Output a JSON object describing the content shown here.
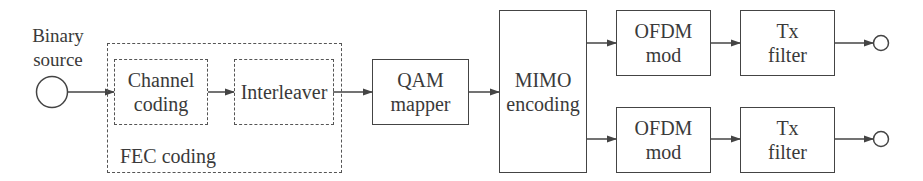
{
  "diagram": {
    "type": "block-diagram",
    "title": "",
    "source": {
      "label_line1": "Binary",
      "label_line2": "source"
    },
    "fec_group": {
      "label": "FEC coding",
      "blocks": [
        {
          "id": "channel_coding",
          "line1": "Channel",
          "line2": "coding"
        },
        {
          "id": "interleaver",
          "line1": "Interleaver",
          "line2": ""
        }
      ]
    },
    "blocks": [
      {
        "id": "qam_mapper",
        "line1": "QAM",
        "line2": "mapper"
      },
      {
        "id": "mimo_encoding",
        "line1": "MIMO",
        "line2": "encoding"
      }
    ],
    "branches": [
      {
        "ofdm": {
          "line1": "OFDM",
          "line2": "mod"
        },
        "tx": {
          "line1": "Tx",
          "line2": "filter"
        }
      },
      {
        "ofdm": {
          "line1": "OFDM",
          "line2": "mod"
        },
        "tx": {
          "line1": "Tx",
          "line2": "filter"
        }
      }
    ],
    "edges": [
      [
        "binary_source",
        "channel_coding"
      ],
      [
        "channel_coding",
        "interleaver"
      ],
      [
        "interleaver",
        "qam_mapper"
      ],
      [
        "qam_mapper",
        "mimo_encoding"
      ],
      [
        "mimo_encoding",
        "ofdm_mod_1"
      ],
      [
        "mimo_encoding",
        "ofdm_mod_2"
      ],
      [
        "ofdm_mod_1",
        "tx_filter_1"
      ],
      [
        "ofdm_mod_2",
        "tx_filter_2"
      ],
      [
        "tx_filter_1",
        "output_1"
      ],
      [
        "tx_filter_2",
        "output_2"
      ]
    ],
    "colors": {
      "line": "#444444",
      "text": "#3a3a3a",
      "background": "#ffffff"
    }
  }
}
